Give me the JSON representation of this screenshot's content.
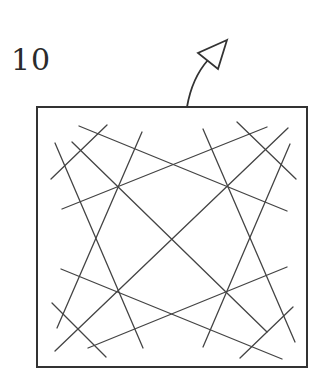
{
  "figure": {
    "label": "10",
    "stroke_color": "#333333",
    "background": "#ffffff"
  },
  "box": {
    "x": 37,
    "y": 107,
    "width": 270,
    "height": 260,
    "stroke_width": 2
  },
  "arrow": {
    "curve": {
      "start": [
        187,
        107
      ],
      "control": [
        192,
        78
      ],
      "end": [
        208,
        60
      ]
    },
    "head": [
      [
        227,
        40
      ],
      [
        198,
        53
      ],
      [
        218,
        69
      ]
    ]
  },
  "lines": [
    {
      "id": "diagonal-tl-br",
      "x1": 72,
      "y1": 142,
      "x2": 267,
      "y2": 332
    },
    {
      "id": "diagonal-tr-bl",
      "x1": 288,
      "y1": 128,
      "x2": 55,
      "y2": 351
    },
    {
      "id": "upper-rising",
      "x1": 62,
      "y1": 209,
      "x2": 267,
      "y2": 127
    },
    {
      "id": "upper-falling",
      "x1": 79,
      "y1": 126,
      "x2": 287,
      "y2": 211
    },
    {
      "id": "lower-falling",
      "x1": 61,
      "y1": 269,
      "x2": 282,
      "y2": 359
    },
    {
      "id": "lower-rising",
      "x1": 88,
      "y1": 348,
      "x2": 287,
      "y2": 267
    },
    {
      "id": "left-steep-a",
      "x1": 142,
      "y1": 132,
      "x2": 57,
      "y2": 328
    },
    {
      "id": "left-steep-b",
      "x1": 55,
      "y1": 143,
      "x2": 143,
      "y2": 348
    },
    {
      "id": "right-steep-a",
      "x1": 203,
      "y1": 129,
      "x2": 295,
      "y2": 342
    },
    {
      "id": "right-steep-b",
      "x1": 290,
      "y1": 144,
      "x2": 203,
      "y2": 347
    },
    {
      "id": "corner-tl",
      "x1": 51,
      "y1": 179,
      "x2": 107,
      "y2": 125
    },
    {
      "id": "corner-tr",
      "x1": 237,
      "y1": 122,
      "x2": 296,
      "y2": 179
    },
    {
      "id": "corner-bl",
      "x1": 52,
      "y1": 303,
      "x2": 106,
      "y2": 357
    },
    {
      "id": "corner-br",
      "x1": 240,
      "y1": 358,
      "x2": 293,
      "y2": 307
    }
  ]
}
